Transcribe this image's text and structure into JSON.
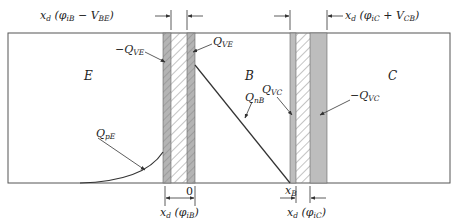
{
  "diagram": {
    "type": "bipolar-transistor-charge-distribution",
    "regions": {
      "emitter": "E",
      "base": "B",
      "collector": "C"
    },
    "charges": {
      "neg_qve": {
        "pre": "−Q",
        "sub": "VE"
      },
      "qve": {
        "pre": "Q",
        "sub": "VE"
      },
      "qnb": {
        "pre": "Q",
        "sub": "nB"
      },
      "qvc": {
        "pre": "Q",
        "sub": "VC"
      },
      "neg_qvc": {
        "pre": "−Q",
        "sub": "VC"
      },
      "qpe": {
        "pre": "Q",
        "sub": "pE"
      }
    },
    "dimensions": {
      "top_left": {
        "pre": "x",
        "sub1": "d",
        "mid": " (φ",
        "sub2": "iB",
        "post": " − V",
        "sub3": "BE",
        "end": ")"
      },
      "top_right": {
        "pre": "x",
        "sub1": "d",
        "mid": " (φ",
        "sub2": "iC",
        "post": " + V",
        "sub3": "CB",
        "end": ")"
      },
      "bottom_left": {
        "pre": "x",
        "sub1": "d",
        "mid": " (φ",
        "sub2": "iB",
        "end": ")"
      },
      "bottom_right": {
        "pre": "x",
        "sub1": "d",
        "mid": " (φ",
        "sub2": "iC",
        "end": ")"
      },
      "origin": "0",
      "xb": {
        "pre": "x",
        "sub": "B"
      }
    },
    "colors": {
      "line": "#333333",
      "strip_fill": "#b8b8b8",
      "hatch": "#888888"
    }
  }
}
